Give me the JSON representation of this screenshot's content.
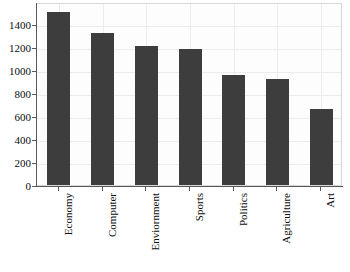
{
  "chart_data": {
    "type": "bar",
    "title": "",
    "xlabel": "",
    "ylabel": "",
    "categories": [
      "Economy",
      "Computer",
      "Enviornment",
      "Sports",
      "Politics",
      "Agriculture",
      "Art"
    ],
    "values": [
      1500,
      1320,
      1210,
      1180,
      960,
      920,
      660
    ],
    "ylim": [
      0,
      1590
    ],
    "yticks": [
      0,
      200,
      400,
      600,
      800,
      1000,
      1200,
      1400
    ],
    "ytick_labels": [
      "0",
      "200",
      "400",
      "600",
      "800",
      "1000",
      "1200",
      "1400"
    ],
    "grid": true,
    "legend": false,
    "bar_color": "#3d3d3d",
    "background_color": "#ffffff",
    "gridline_color": "#ececec",
    "axis_color": "#585858",
    "tick_label_color": "#0d0d0d",
    "xtick_label_rotation": 90
  }
}
